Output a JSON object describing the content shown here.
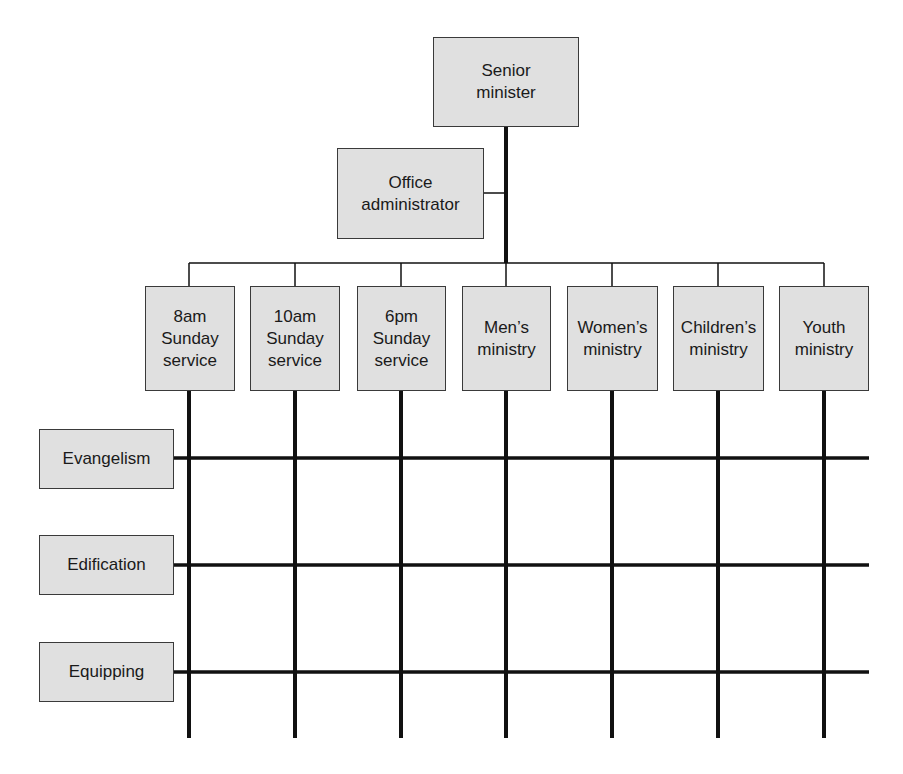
{
  "diagram": {
    "type": "matrix org chart",
    "top": {
      "label": "Senior\nminister"
    },
    "staff": {
      "label": "Office\nadministrator"
    },
    "columns": [
      {
        "label": "8am\nSunday\nservice"
      },
      {
        "label": "10am\nSunday\nservice"
      },
      {
        "label": "6pm\nSunday\nservice"
      },
      {
        "label": "Men’s\nministry"
      },
      {
        "label": "Women’s\nministry"
      },
      {
        "label": "Children’s\nministry"
      },
      {
        "label": "Youth\nministry"
      }
    ],
    "rows": [
      {
        "label": "Evangelism"
      },
      {
        "label": "Edification"
      },
      {
        "label": "Equipping"
      }
    ],
    "colors": {
      "box_fill": "#e0e0e0",
      "box_border": "#3a3a3a",
      "line": "#111111"
    }
  }
}
